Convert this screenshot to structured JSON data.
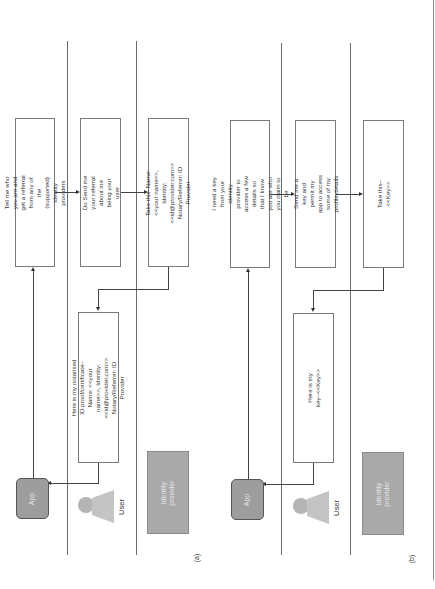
{
  "panels": [
    {
      "label": "(a)",
      "actors": {
        "app": "App",
        "user": "User",
        "identity_provider": "Identity provider"
      },
      "messages": [
        {
          "id": "m1",
          "text": "Tell me who you are and get a referral from any of the (supported) identity providers"
        },
        {
          "id": "m2",
          "text": "Do Send me your referral about me being your user"
        },
        {
          "id": "m3",
          "text": "Take this–Name: <<your name>>, Identity: <<id@provider.com>> Notary/Referrer: ID Provider"
        },
        {
          "id": "m4",
          "text": "Here is my notarised ID proof/certificate–Name: <<your name>>, Identity: <<id@provider.com>> Notary/Referrer: ID Provider"
        }
      ]
    },
    {
      "label": "(b)",
      "actors": {
        "app": "App",
        "user": "User",
        "identity_provider": "Identity provider"
      },
      "messages": [
        {
          "id": "m1",
          "text": "I need a key from your identity provider to access a few details so that I know you are who you claim to be"
        },
        {
          "id": "m2",
          "text": "Send me a key and permit my app to access some of my profile details"
        },
        {
          "id": "m3",
          "text": "Take this–<<Key>>"
        },
        {
          "id": "m4",
          "text": "Here is my key–<<Key>>"
        }
      ]
    }
  ],
  "colors": {
    "actor_fill": "#9d9d9d",
    "idp_fill": "#a9a9a9",
    "line": "#6b6b6b"
  }
}
